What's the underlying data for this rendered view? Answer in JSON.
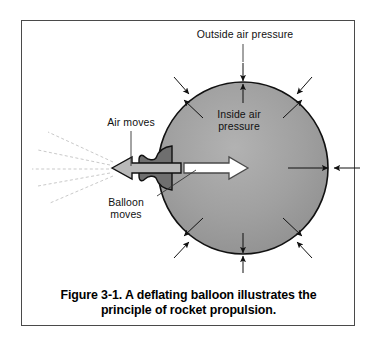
{
  "figure": {
    "caption_line_1": "Figure 3-1. A deflating balloon illustrates the",
    "caption_line_2": "principle of rocket propulsion.",
    "caption_full": "Figure 3-1. A deflating balloon illustrates the principle of rocket propulsion."
  },
  "labels": {
    "outside_air_pressure": "Outside air pressure",
    "inside_air_pressure": "Inside air\npressure",
    "air_moves": "Air moves",
    "balloon_moves": "Balloon\nmoves"
  },
  "colors": {
    "frame_border": "#4a4a4a",
    "background": "#ffffff",
    "balloon_fill": "#9a9a9a",
    "balloon_fill_light": "#b0b0b0",
    "balloon_outline": "#111111",
    "nozzle_fill": "#6f6f6f",
    "air_arrow_fill": "#b9b9b9",
    "balloon_arrow_fill": "#ffffff",
    "arrow_stroke": "#111111",
    "escaping_air": "#c9c9c9",
    "text": "#111111"
  },
  "diagram": {
    "balloon": {
      "center_x": 243,
      "center_y": 168,
      "radius_x": 85,
      "radius_y": 86
    },
    "nozzle": {
      "x": 140,
      "y": 168
    },
    "air_arrow": {
      "direction": "left",
      "tip_x": 112,
      "tail_x": 180,
      "y": 168
    },
    "balloon_arrow": {
      "direction": "right",
      "tail_x": 184,
      "tip_x": 248,
      "y": 168
    },
    "outside_pressure_arrows": 8,
    "inside_pressure_arrows": 8,
    "escaping_air_streams": 5
  }
}
